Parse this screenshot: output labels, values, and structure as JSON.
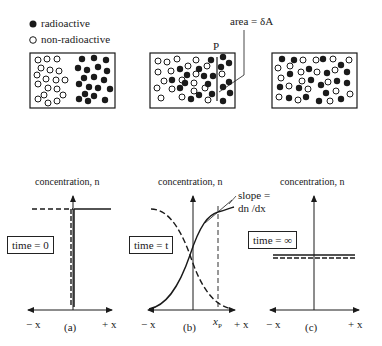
{
  "legend": {
    "items": [
      {
        "symbol": "filled-circle",
        "label": "radioactive"
      },
      {
        "symbol": "open-circle",
        "label": "non-radioactive"
      }
    ]
  },
  "top_panels": {
    "annotation_area": "area = δA",
    "plane_label": "P"
  },
  "graphs": [
    {
      "id": "a",
      "caption": "(a)",
      "axis_title": "concentration, n",
      "time_label": "time = 0",
      "x_neg": "− x",
      "x_pos": "+ x"
    },
    {
      "id": "b",
      "caption": "(b)",
      "axis_title": "concentration, n",
      "time_label": "time = t",
      "x_neg": "− x",
      "x_pos": "+ x",
      "xp_label": "x",
      "xp_sub": "P",
      "slope_label_1": "slope =",
      "slope_label_2": "dn /dx"
    },
    {
      "id": "c",
      "caption": "(c)",
      "axis_title": "concentration, n",
      "time_label": "time = ∞",
      "x_neg": "− x",
      "x_pos": "+ x"
    }
  ],
  "colors": {
    "ink": "#1a1a1a",
    "background": "#ffffff"
  }
}
